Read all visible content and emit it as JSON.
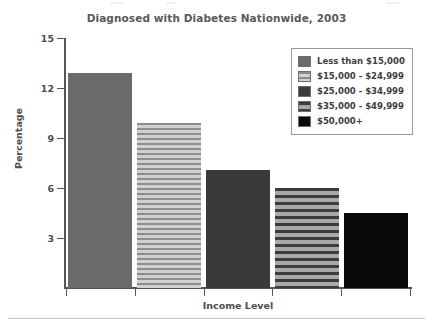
{
  "chart_data": {
    "type": "bar",
    "title": "Diagnosed with Diabetes Nationwide, 2003",
    "xlabel": "Income Level",
    "ylabel": "Percentage",
    "ylim": [
      0,
      15
    ],
    "yticks": [
      3,
      6,
      9,
      12,
      15
    ],
    "ytick_labels": [
      "3",
      "6",
      "9",
      "12",
      "15"
    ],
    "grid": false,
    "legend_position": "top-right",
    "categories": [
      "Less than $15,000",
      "$15,000 - $24,999",
      "$25,000 - $34,999",
      "$35,000 - $49,999",
      "$50,000+"
    ],
    "values": [
      12.9,
      9.9,
      7.1,
      6.0,
      4.5
    ],
    "series": [
      {
        "name": "Percentage",
        "values": [
          12.9,
          9.9,
          7.1,
          6.0,
          4.5
        ]
      }
    ],
    "bars": [
      {
        "label": "Less than $15,000",
        "value": 12.9,
        "pattern": "solid-mid",
        "color": "#6b6b6b"
      },
      {
        "label": "$15,000 - $24,999",
        "value": 9.9,
        "pattern": "stripe-thin",
        "color": "#b7b7b7"
      },
      {
        "label": "$25,000 - $34,999",
        "value": 7.1,
        "pattern": "solid-dark",
        "color": "#3a3a3a"
      },
      {
        "label": "$35,000 - $49,999",
        "value": 6.0,
        "pattern": "stripe-thick",
        "color": "#6f6f6f"
      },
      {
        "label": "$50,000+",
        "value": 4.5,
        "pattern": "solid-black",
        "color": "#0a0a0a"
      }
    ]
  },
  "legend": {
    "items": [
      {
        "label": "Less than $15,000",
        "pattern": "solid-mid"
      },
      {
        "label": "$15,000 - $24,999",
        "pattern": "stripe-thin"
      },
      {
        "label": "$25,000 - $34,999",
        "pattern": "solid-dark"
      },
      {
        "label": "$35,000 - $49,999",
        "pattern": "stripe-thick"
      },
      {
        "label": "$50,000+",
        "pattern": "solid-black"
      }
    ]
  },
  "axes": {
    "y_title": "Percentage",
    "x_title": "Income Level",
    "y_tick_labels": [
      "15",
      "12",
      "9",
      "6",
      "3"
    ]
  },
  "colors": {
    "axis": "#555555",
    "text": "#4d4d4d",
    "title": "#595959",
    "legend_border": "#9a9a9a",
    "rule": "#c8c8c8"
  }
}
